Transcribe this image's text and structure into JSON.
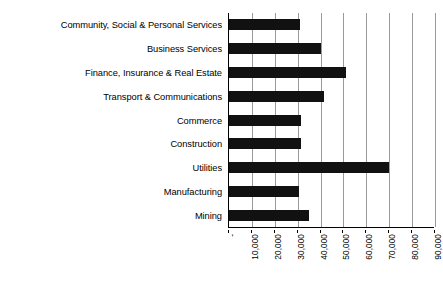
{
  "chart_data": {
    "type": "bar",
    "orientation": "horizontal",
    "title": "",
    "xlabel": "",
    "ylabel": "",
    "grid": true,
    "legend": false,
    "xlim": [
      0,
      90000
    ],
    "xticks": [
      0,
      10000,
      20000,
      30000,
      40000,
      50000,
      60000,
      70000,
      80000,
      90000
    ],
    "xtick_labels": [
      "-",
      "10,000",
      "20,000",
      "30,000",
      "40,000",
      "50,000",
      "60,000",
      "70,000",
      "80,000",
      "90,000"
    ],
    "categories": [
      "Community, Social & Personal Services",
      "Business Services",
      "Finance, Insurance & Real Estate",
      "Transport & Communications",
      "Commerce",
      "Construction",
      "Utilities",
      "Manufacturing",
      "Mining"
    ],
    "values": [
      31200,
      40400,
      51300,
      41500,
      31600,
      31500,
      69900,
      30800,
      34900
    ],
    "bar_color": "#111111",
    "gridline_color": "#9a9a9a",
    "axis_color": "#000000"
  }
}
